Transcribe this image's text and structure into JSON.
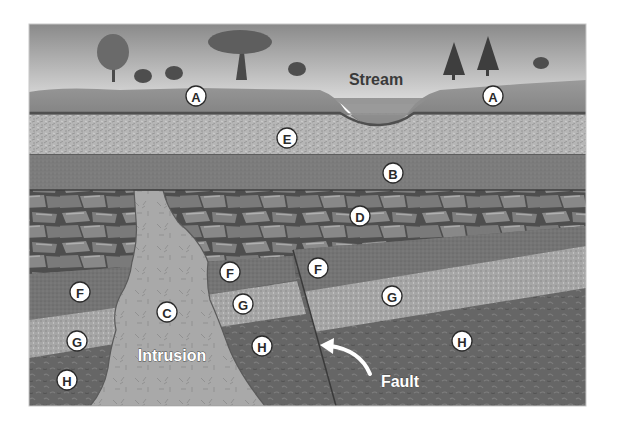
{
  "diagram": {
    "captions": {
      "stream": "Stream",
      "intrusion": "Intrusion",
      "fault": "Fault"
    },
    "layer_labels": [
      {
        "id": "A",
        "text": "A",
        "desc": "topsoil / surface layer (left)"
      },
      {
        "id": "A2",
        "text": "A",
        "desc": "topsoil / surface layer (right)"
      },
      {
        "id": "E",
        "text": "E",
        "desc": "sandy layer"
      },
      {
        "id": "B",
        "text": "B",
        "desc": "fine-grained layer"
      },
      {
        "id": "D",
        "text": "D",
        "desc": "blocky rock layer"
      },
      {
        "id": "C",
        "text": "C",
        "desc": "igneous intrusion"
      },
      {
        "id": "F1",
        "text": "F",
        "desc": "left of intrusion"
      },
      {
        "id": "F2",
        "text": "F",
        "desc": "between intrusion and fault"
      },
      {
        "id": "F3",
        "text": "F",
        "desc": "right of fault"
      },
      {
        "id": "G1",
        "text": "G",
        "desc": "left of intrusion"
      },
      {
        "id": "G2",
        "text": "G",
        "desc": "between intrusion and fault"
      },
      {
        "id": "G3",
        "text": "G",
        "desc": "right of fault"
      },
      {
        "id": "H1",
        "text": "H",
        "desc": "left of intrusion"
      },
      {
        "id": "H2",
        "text": "H",
        "desc": "between intrusion and fault"
      },
      {
        "id": "H3",
        "text": "H",
        "desc": "right of fault"
      }
    ],
    "colors": {
      "sky_top": "#8a8a8a",
      "sky_bottom": "#dcdcdc",
      "layer_A": "#8c8c8c",
      "layer_E": "#b4b4b4",
      "layer_B": "#7e7e7e",
      "layer_D": "#6e6e6e",
      "layer_F": "#767676",
      "layer_G": "#aaaaaa",
      "layer_H": "#656565",
      "intrusion_C": "#a8a8a8",
      "stream": "#8e8e8e"
    }
  }
}
